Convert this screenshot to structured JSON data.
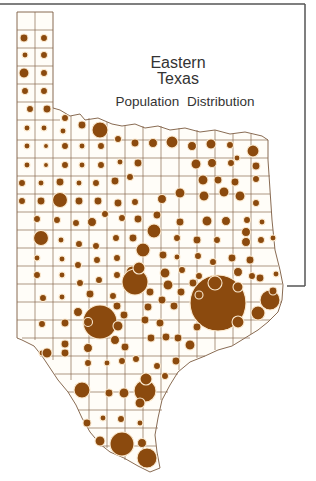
{
  "title": {
    "line1": "Eastern",
    "line2": "Texas",
    "line3": "Population  Distribution"
  },
  "colors": {
    "circle_fill": "#8b4a0e",
    "circle_halo": "#fbe9cf",
    "county_line": "#8a6a50",
    "frame": "#555555",
    "background": "#ffffff"
  },
  "legend": "proportional circles by county population",
  "notable_circles": [
    {
      "area": "Dallas",
      "cx": 151,
      "cy": 181,
      "r": 19
    },
    {
      "area": "Houston",
      "cx": 218,
      "cy": 303,
      "r": 28
    },
    {
      "area": "San Antonio",
      "cx": 100,
      "cy": 322,
      "r": 17
    },
    {
      "area": "Austin",
      "cx": 135,
      "cy": 282,
      "r": 13
    },
    {
      "area": "Corpus Christi",
      "cx": 145,
      "cy": 391,
      "r": 11
    },
    {
      "area": "Hidalgo",
      "cx": 122,
      "cy": 444,
      "r": 12
    },
    {
      "area": "Cameron",
      "cx": 147,
      "cy": 458,
      "r": 10
    },
    {
      "area": "Beaumont",
      "cx": 270,
      "cy": 300,
      "r": 10
    }
  ]
}
